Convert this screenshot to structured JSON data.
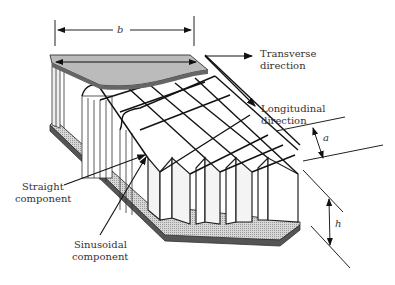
{
  "figure": {
    "labels": {
      "b": "b",
      "a": "a",
      "h": "h",
      "transverse_line1": "Transverse",
      "transverse_line2": "direction",
      "longitudinal_line1": "Longitudinal",
      "longitudinal_line2": "direction",
      "straight_line1": "Straight",
      "straight_line2": "component",
      "sinusoidal_line1": "Sinusoidal",
      "sinusoidal_line2": "component"
    },
    "colors": {
      "line": "#1a1a1a",
      "face_sheet_fill": "#b8b8b8",
      "face_sheet_edge": "#555555",
      "bottom_fill": "#c4c4c4",
      "text": "#333333"
    }
  }
}
